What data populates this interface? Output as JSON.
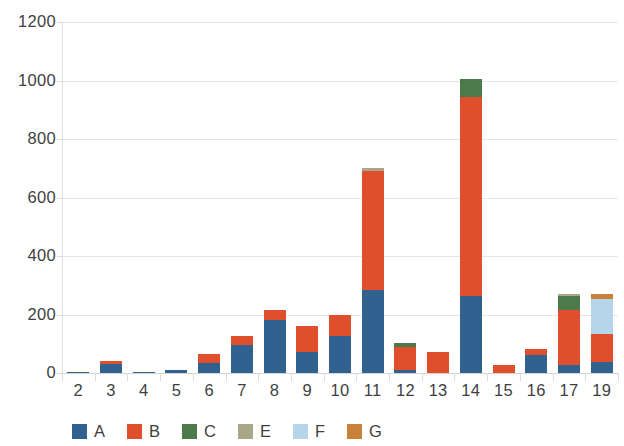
{
  "chart_data": {
    "type": "bar",
    "subtype": "stacked-vertical",
    "title": "",
    "subtitle": "",
    "xlabel": "",
    "ylabel": "",
    "ylim": [
      0,
      1200
    ],
    "ytick_step": 200,
    "ytick_labels": [
      "0",
      "200",
      "400",
      "600",
      "800",
      "1000",
      "1200"
    ],
    "ytick_values": [
      0,
      200,
      400,
      600,
      800,
      1000,
      1200
    ],
    "grid": true,
    "grid_axis": "y",
    "legend_position": "bottom",
    "categories": [
      "2",
      "3",
      "4",
      "5",
      "6",
      "7",
      "8",
      "9",
      "10",
      "11",
      "12",
      "13",
      "14",
      "15",
      "16",
      "17",
      "19"
    ],
    "series": [
      {
        "name": "A",
        "color": "#31628f",
        "values": [
          3,
          30,
          2,
          9,
          33,
          95,
          180,
          72,
          128,
          285,
          10,
          0,
          265,
          0,
          62,
          28,
          36
        ]
      },
      {
        "name": "B",
        "color": "#e04f2b",
        "values": [
          0,
          10,
          0,
          0,
          32,
          32,
          35,
          88,
          72,
          405,
          78,
          72,
          680,
          27,
          20,
          188,
          98
        ]
      },
      {
        "name": "C",
        "color": "#4c7a4a",
        "values": [
          0,
          0,
          0,
          0,
          0,
          0,
          0,
          0,
          0,
          0,
          14,
          0,
          60,
          0,
          0,
          47,
          0
        ]
      },
      {
        "name": "E",
        "color": "#a9a788",
        "values": [
          0,
          0,
          0,
          0,
          0,
          0,
          0,
          0,
          0,
          10,
          0,
          0,
          0,
          0,
          0,
          8,
          0
        ]
      },
      {
        "name": "F",
        "color": "#b7d5ea",
        "values": [
          0,
          0,
          0,
          0,
          0,
          0,
          0,
          0,
          0,
          0,
          0,
          0,
          0,
          0,
          0,
          0,
          120
        ]
      },
      {
        "name": "G",
        "color": "#c8813a",
        "values": [
          0,
          0,
          0,
          0,
          0,
          0,
          0,
          0,
          0,
          0,
          0,
          0,
          0,
          0,
          0,
          0,
          15
        ]
      }
    ],
    "totals": [
      3,
      40,
      2,
      9,
      65,
      127,
      215,
      160,
      200,
      700,
      102,
      72,
      1005,
      27,
      82,
      271,
      269
    ]
  },
  "legend": {
    "items": [
      {
        "label": "A",
        "color": "#31628f"
      },
      {
        "label": "B",
        "color": "#e04f2b"
      },
      {
        "label": "C",
        "color": "#4c7a4a"
      },
      {
        "label": "E",
        "color": "#a9a788"
      },
      {
        "label": "F",
        "color": "#b7d5ea"
      },
      {
        "label": "G",
        "color": "#c8813a"
      }
    ]
  },
  "colors": {
    "background": "#ffffff",
    "gridline": "#e4e4e4",
    "axis": "#d3d3d3",
    "text": "#3f3f3f"
  }
}
